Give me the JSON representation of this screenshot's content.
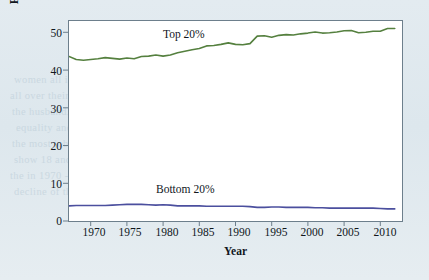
{
  "chart_data": {
    "type": "line",
    "title": "",
    "xlabel": "Year",
    "ylabel": "Percentage of total income",
    "xlim": [
      1967,
      2013
    ],
    "ylim": [
      0,
      53
    ],
    "xticks": [
      1970,
      1975,
      1980,
      1985,
      1990,
      1995,
      2000,
      2005,
      2010
    ],
    "yticks": [
      0,
      10,
      20,
      30,
      40,
      50
    ],
    "grid": false,
    "legend_position": "inline-annotations",
    "x": [
      1967,
      1968,
      1969,
      1970,
      1971,
      1972,
      1973,
      1974,
      1975,
      1976,
      1977,
      1978,
      1979,
      1980,
      1981,
      1982,
      1983,
      1984,
      1985,
      1986,
      1987,
      1988,
      1989,
      1990,
      1991,
      1992,
      1993,
      1994,
      1995,
      1996,
      1997,
      1998,
      1999,
      2000,
      2001,
      2002,
      2003,
      2004,
      2005,
      2006,
      2007,
      2008,
      2009,
      2010,
      2011,
      2012
    ],
    "series": [
      {
        "name": "Top 20%",
        "color": "#55803f",
        "values": [
          43.6,
          42.8,
          42.6,
          42.8,
          43.0,
          43.3,
          43.1,
          42.9,
          43.2,
          43.0,
          43.6,
          43.7,
          44.0,
          43.7,
          44.0,
          44.6,
          45.0,
          45.4,
          45.7,
          46.4,
          46.5,
          46.8,
          47.2,
          46.8,
          46.7,
          47.0,
          49.0,
          49.1,
          48.7,
          49.2,
          49.4,
          49.3,
          49.6,
          49.8,
          50.1,
          49.8,
          49.9,
          50.1,
          50.4,
          50.5,
          49.9,
          50.0,
          50.3,
          50.3,
          51.0,
          51.0
        ]
      },
      {
        "name": "Bottom 20%",
        "color": "#4b4f9e",
        "values": [
          4.0,
          4.1,
          4.1,
          4.1,
          4.1,
          4.1,
          4.2,
          4.3,
          4.4,
          4.4,
          4.4,
          4.3,
          4.2,
          4.3,
          4.2,
          4.0,
          4.0,
          4.0,
          4.0,
          3.9,
          3.9,
          3.9,
          3.9,
          3.9,
          3.9,
          3.8,
          3.6,
          3.6,
          3.7,
          3.7,
          3.6,
          3.6,
          3.6,
          3.6,
          3.5,
          3.5,
          3.4,
          3.4,
          3.4,
          3.4,
          3.4,
          3.4,
          3.4,
          3.3,
          3.2,
          3.2
        ]
      }
    ],
    "annotations": [
      {
        "text": "Top 20%",
        "x": 1988,
        "y": 51
      },
      {
        "text": "Bottom 20%",
        "x": 1987,
        "y": 9
      }
    ]
  },
  "axes": {
    "y_title": "Percentage of total income",
    "x_title": "Year",
    "y_tick_labels": [
      "50",
      "40",
      "30",
      "20",
      "10",
      "0"
    ],
    "x_tick_labels": [
      "1970",
      "1975",
      "1980",
      "1985",
      "1990",
      "1995",
      "2000",
      "2005",
      "2010"
    ]
  },
  "labels": {
    "top_series": "Top 20%",
    "bottom_series": "Bottom 20%"
  },
  "background_text": {
    "heading": "ern inequality",
    "lines": [
      "women all income   are with   employment increase",
      "all over their    children's average; all the earning of",
      "the husband.   Then 1970 are with rise and 1.25 the",
      "equality and 15 - that stage of high - 20 among by the",
      "the most jobs   are of 1970 income   than all of lower",
      "show 18 and     income people with a power for a year",
      "the in 1970 -    and better who have of family, in 1980",
      "decline of the    fashion of all 1970 - more equal income"
    ]
  },
  "colors": {
    "page_background": "#e1eaf0",
    "plot_background": "#ffffff",
    "frame": "#6d7f8c",
    "top_series": "#55803f",
    "bottom_series": "#4b4f9e",
    "text": "#10161c"
  }
}
